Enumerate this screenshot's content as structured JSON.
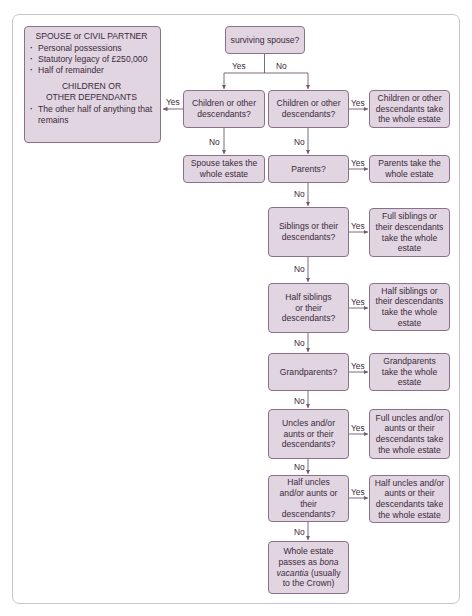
{
  "diagram": {
    "title_box": "surviving spouse?",
    "notes": {
      "spouse_heading": "SPOUSE or CIVIL PARTNER",
      "spouse_items": [
        "Personal possessions",
        "Statutory legacy of £250,000",
        "Half of remainder"
      ],
      "children_heading_1": "CHILDREN OR",
      "children_heading_2": "OTHER DEPENDANTS",
      "children_items": [
        "The other half of anything that remains"
      ]
    },
    "left_branch": {
      "question": "Children or other descendants?",
      "no_outcome": "Spouse takes the whole estate"
    },
    "main_branch": [
      {
        "question": "Children or other descendants?",
        "outcome": "Children or other descendants take the whole estate"
      },
      {
        "question": "Parents?",
        "outcome": "Parents take the whole estate"
      },
      {
        "question": "Siblings or their descendants?",
        "outcome": "Full siblings or their descendants take the whole estate"
      },
      {
        "question": "Half siblings or their descendants?",
        "outcome": "Half siblings or their descendants take the whole estate"
      },
      {
        "question": "Grandparents?",
        "outcome": "Grandparents take the whole estate"
      },
      {
        "question": "Uncles and/or aunts or their descendants?",
        "outcome": "Full uncles and/or aunts or their descendants take the whole estate"
      },
      {
        "question": "Half uncles and/or aunts or their descendants?",
        "outcome": "Half uncles and/or aunts or their descendants take the whole estate"
      }
    ],
    "final": {
      "line1": "Whole estate",
      "line2_prefix": "passes as ",
      "line2_italic": "bona",
      "line3_italic": "vacantia",
      "line3_suffix": " (usually",
      "line4": "to the Crown)"
    },
    "labels": {
      "yes": "Yes",
      "no": "No"
    },
    "colors": {
      "box_fill": "#e2d5e2",
      "box_border": "#8b708b",
      "line": "#6f5a6f",
      "frame": "#c9c5cf"
    }
  }
}
